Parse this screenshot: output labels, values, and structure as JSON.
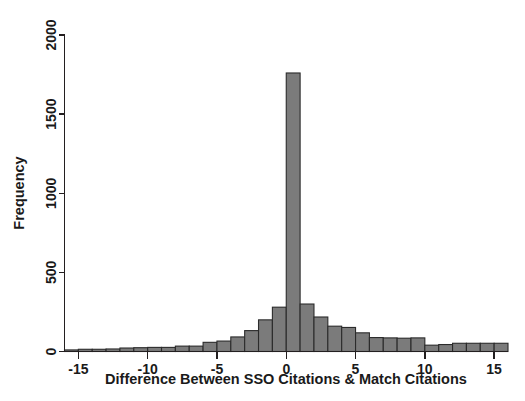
{
  "figure": {
    "background_color": "#ffffff",
    "bar_fill_color": "#7b7b7b",
    "bar_edge_color": "#2b2b2b",
    "axis_color": "#231f20"
  },
  "chart_data": {
    "type": "bar",
    "title": "",
    "subtitle": "",
    "xlabel": "Difference Between SSO Citations & Match Citations",
    "ylabel": "Frequency",
    "xlim": [
      -16,
      16
    ],
    "ylim": [
      0,
      2100
    ],
    "grid": false,
    "legend": null,
    "bin_width": 1,
    "xticks": [
      -15,
      -10,
      -5,
      0,
      5,
      10,
      15
    ],
    "xtick_labels": [
      "-15",
      "-10",
      "-5",
      "0",
      "5",
      "10",
      "15"
    ],
    "yticks": [
      0,
      500,
      1000,
      1500,
      2000
    ],
    "ytick_labels": [
      "0",
      "500",
      "1000",
      "1500",
      "2000"
    ],
    "categories": [
      -15.5,
      -14.5,
      -13.5,
      -12.5,
      -11.5,
      -10.5,
      -9.5,
      -8.5,
      -7.5,
      -6.5,
      -5.5,
      -4.5,
      -3.5,
      -2.5,
      -1.5,
      -0.5,
      0.5,
      1.5,
      2.5,
      3.5,
      4.5,
      5.5,
      6.5,
      7.5,
      8.5,
      9.5,
      10.5,
      11.5,
      12.5,
      13.5,
      14.5,
      15.5
    ],
    "values": [
      10,
      14,
      14,
      16,
      22,
      24,
      26,
      26,
      34,
      34,
      58,
      66,
      92,
      132,
      200,
      280,
      1760,
      300,
      218,
      160,
      152,
      118,
      88,
      86,
      84,
      86,
      40,
      44,
      52,
      52,
      52,
      52
    ],
    "peak_value": 1760,
    "peak_category": 0
  },
  "annotations": {
    "x_axis_label_text": "Difference Between SSO Citations & Match Citations",
    "y_axis_label_text": "Frequency"
  }
}
